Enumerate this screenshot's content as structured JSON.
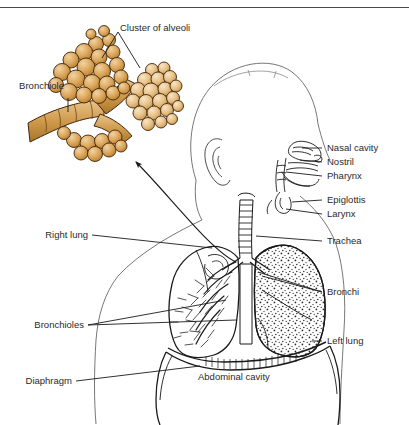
{
  "figure": {
    "title_partial": "",
    "background_color": "#ffffff",
    "ink_color": "#1a1a1a",
    "alveoli_fill": "#d79a4e",
    "alveoli_fill_light": "#ecc893",
    "alveoli_outline": "#4a2c10"
  },
  "labels": {
    "cluster_of_alveoli": "Cluster of alveoli",
    "bronchiole": "Bronchiole",
    "nasal_cavity": "Nasal cavity",
    "nostril": "Nostril",
    "pharynx": "Pharynx",
    "epiglottis": "Epiglottis",
    "larynx": "Larynx",
    "trachea": "Trachea",
    "bronchi": "Bronchi",
    "left_lung": "Left lung",
    "right_lung": "Right lung",
    "bronchioles": "Bronchioles",
    "diaphragm": "Diaphragm",
    "abdominal_cavity": "Abdominal cavity"
  },
  "structures": {
    "head_profile": "head-profile-outline",
    "right_lung_tree": "bronchial-tree",
    "left_lung_stipple": "stippled-lung-tissue",
    "trachea_rings": "cartilage-rings",
    "diaphragm_dome": "diaphragm-muscle",
    "magnify_arrow": "callout-arrow-to-alveoli"
  }
}
